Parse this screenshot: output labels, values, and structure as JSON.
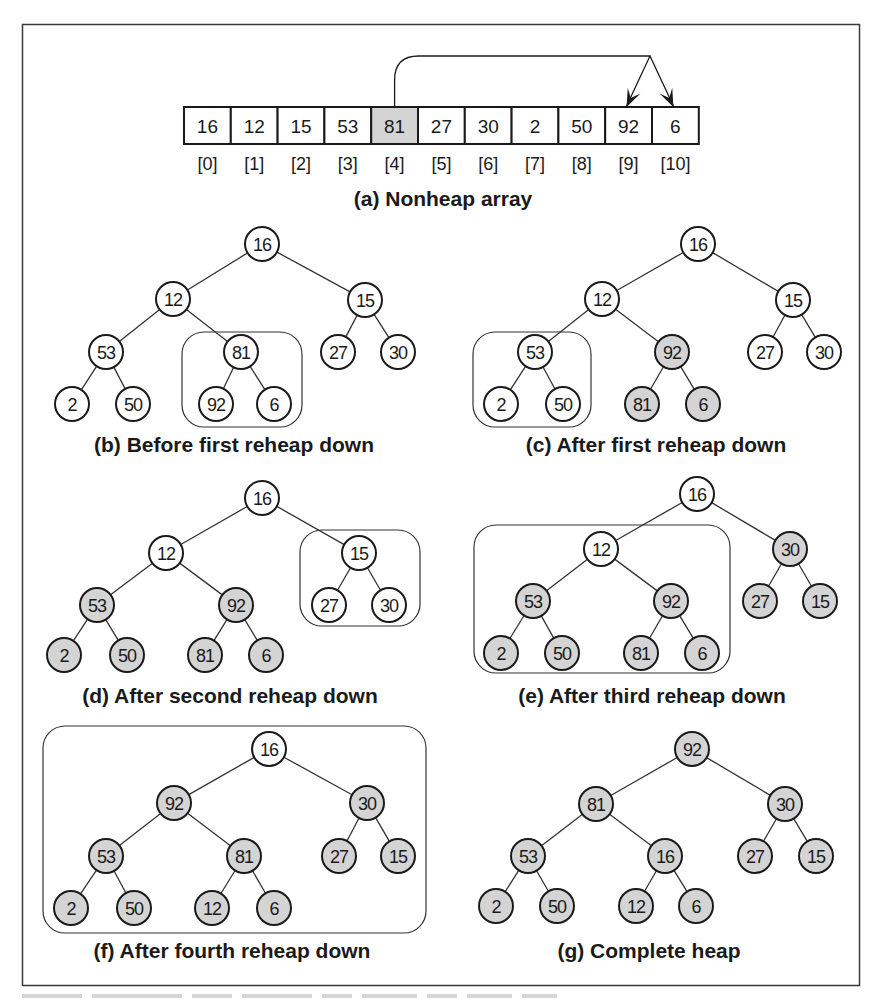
{
  "colors": {
    "stroke": "#1a1a1a",
    "highlight_fill": "#d4d4d4",
    "plain_fill": "#ffffff",
    "frame": "#3a3a3a"
  },
  "array_panel": {
    "caption": "(a) Nonheap array",
    "values": [
      "16",
      "12",
      "15",
      "53",
      "81",
      "27",
      "30",
      "2",
      "50",
      "92",
      "6"
    ],
    "indices": [
      "[0]",
      "[1]",
      "[2]",
      "[3]",
      "[4]",
      "[5]",
      "[6]",
      "[7]",
      "[8]",
      "[9]",
      "[10]"
    ],
    "highlighted_index": 4,
    "arrow": {
      "from_index": 4,
      "to_indices": [
        9,
        10
      ]
    }
  },
  "tree_panels": [
    {
      "id": "b",
      "caption": "(b) Before first reheap down",
      "nodes": [
        "16",
        "12",
        "15",
        "53",
        "81",
        "27",
        "30",
        "2",
        "50",
        "92",
        "6"
      ],
      "shaded": [
        false,
        false,
        false,
        false,
        false,
        false,
        false,
        false,
        false,
        false,
        false
      ],
      "highlight_subtree_root": 4
    },
    {
      "id": "c",
      "caption": "(c) After first reheap down",
      "nodes": [
        "16",
        "12",
        "15",
        "53",
        "92",
        "27",
        "30",
        "2",
        "50",
        "81",
        "6"
      ],
      "shaded": [
        false,
        false,
        false,
        false,
        true,
        false,
        false,
        false,
        false,
        true,
        true
      ],
      "highlight_subtree_root": 3
    },
    {
      "id": "d",
      "caption": "(d) After second reheap down",
      "nodes": [
        "16",
        "12",
        "15",
        "53",
        "92",
        "27",
        "30",
        "2",
        "50",
        "81",
        "6"
      ],
      "shaded": [
        false,
        false,
        false,
        true,
        true,
        false,
        false,
        true,
        true,
        true,
        true
      ],
      "highlight_subtree_root": 2
    },
    {
      "id": "e",
      "caption": "(e) After third reheap down",
      "nodes": [
        "16",
        "12",
        "30",
        "53",
        "92",
        "27",
        "15",
        "2",
        "50",
        "81",
        "6"
      ],
      "shaded": [
        false,
        false,
        true,
        true,
        true,
        true,
        true,
        true,
        true,
        true,
        true
      ],
      "highlight_subtree_root": 1
    },
    {
      "id": "f",
      "caption": "(f) After fourth reheap down",
      "nodes": [
        "16",
        "92",
        "30",
        "53",
        "81",
        "27",
        "15",
        "2",
        "50",
        "12",
        "6"
      ],
      "shaded": [
        false,
        true,
        true,
        true,
        true,
        true,
        true,
        true,
        true,
        true,
        true
      ],
      "highlight_subtree_root": 0
    },
    {
      "id": "g",
      "caption": "(g) Complete heap",
      "nodes": [
        "92",
        "81",
        "30",
        "53",
        "16",
        "27",
        "15",
        "2",
        "50",
        "12",
        "6"
      ],
      "shaded": [
        true,
        true,
        true,
        true,
        true,
        true,
        true,
        true,
        true,
        true,
        true
      ],
      "highlight_subtree_root": null
    }
  ]
}
